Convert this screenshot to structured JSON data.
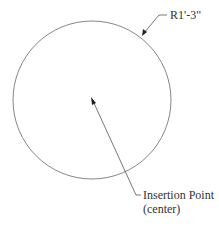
{
  "diagram": {
    "radius_label": "R1'-3\"",
    "insertion_label_line1": "Insertion Point",
    "insertion_label_line2": "(center)",
    "stroke_color": "#555555"
  }
}
